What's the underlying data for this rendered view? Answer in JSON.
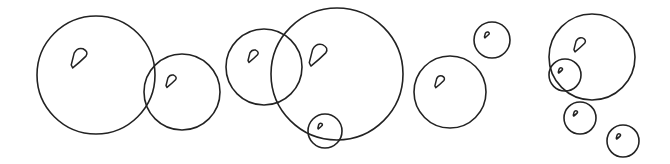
{
  "illustration": {
    "title": "Bubbles line drawing",
    "stroke": "#222222",
    "background": "#ffffff",
    "bubbles": [
      {
        "cx": 96,
        "cy": 75,
        "r": 59
      },
      {
        "cx": 182,
        "cy": 92,
        "r": 38
      },
      {
        "cx": 264,
        "cy": 67,
        "r": 38
      },
      {
        "cx": 337,
        "cy": 74,
        "r": 66
      },
      {
        "cx": 325,
        "cy": 131,
        "r": 17
      },
      {
        "cx": 450,
        "cy": 92,
        "r": 36
      },
      {
        "cx": 492,
        "cy": 40,
        "r": 18
      },
      {
        "cx": 592,
        "cy": 57,
        "r": 43
      },
      {
        "cx": 565,
        "cy": 75,
        "r": 16
      },
      {
        "cx": 580,
        "cy": 118,
        "r": 16
      },
      {
        "cx": 623,
        "cy": 141,
        "r": 16
      }
    ]
  }
}
